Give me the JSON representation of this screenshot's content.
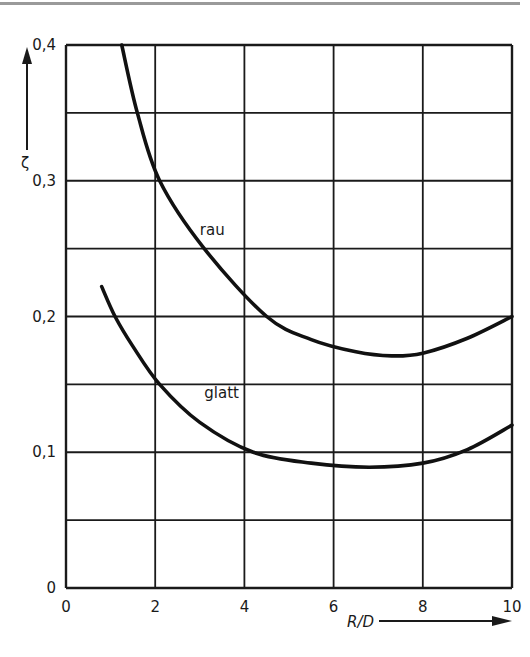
{
  "chart_data": {
    "type": "line",
    "title": "",
    "xlabel": "R/D",
    "ylabel": "ζ",
    "xlim": [
      0,
      10
    ],
    "ylim": [
      0,
      0.4
    ],
    "grid": true,
    "x_ticks": [
      "0",
      "2",
      "4",
      "6",
      "8",
      "10"
    ],
    "y_ticks": [
      "0",
      "0,1",
      "0,2",
      "0,3",
      "0,4"
    ],
    "series": [
      {
        "name": "rau",
        "x": [
          1.25,
          1.6,
          2.1,
          3.1,
          4.5,
          5.5,
          6.5,
          7.3,
          8.0,
          9.0,
          10.0
        ],
        "y": [
          0.4,
          0.35,
          0.3,
          0.25,
          0.2,
          0.183,
          0.174,
          0.171,
          0.173,
          0.184,
          0.2
        ]
      },
      {
        "name": "glatt",
        "x": [
          0.8,
          1.1,
          1.5,
          2.1,
          3.0,
          4.2,
          5.5,
          6.8,
          8.0,
          9.0,
          10.0
        ],
        "y": [
          0.222,
          0.2,
          0.178,
          0.15,
          0.122,
          0.1,
          0.092,
          0.089,
          0.092,
          0.102,
          0.12
        ]
      }
    ],
    "annotations": [
      {
        "text": "rau",
        "x": 3.0,
        "y": 0.26
      },
      {
        "text": "glatt",
        "x": 3.1,
        "y": 0.14
      }
    ]
  },
  "labels": {
    "x_axis_title": "R/D",
    "y_axis_title": "ζ",
    "rau": "rau",
    "glatt": "glatt"
  }
}
